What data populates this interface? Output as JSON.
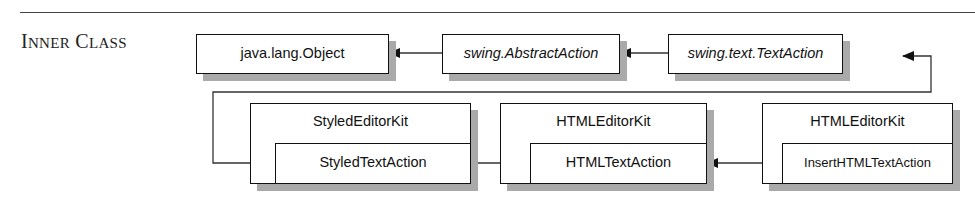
{
  "section": {
    "label_first": "I",
    "label_first_rest": "NNER",
    "label_second": "C",
    "label_second_rest": "LASS"
  },
  "diagram": {
    "top_row": [
      {
        "name": "java.lang.Object",
        "italic": false
      },
      {
        "name": "swing.AbstractAction",
        "italic": true
      },
      {
        "name": "swing.text.TextAction",
        "italic": true
      }
    ],
    "bottom_row": [
      {
        "outer": "StyledEditorKit",
        "inner": "StyledTextAction"
      },
      {
        "outer": "HTMLEditorKit",
        "inner": "HTMLTextAction"
      },
      {
        "outer": "HTMLEditorKit",
        "inner": "InsertHTMLTextAction"
      }
    ]
  }
}
